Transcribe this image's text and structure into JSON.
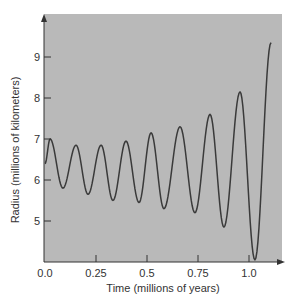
{
  "chart_data": {
    "type": "line",
    "title": "",
    "xlabel": "Time (millions of years)",
    "ylabel": "Radius (millions of kilometers)",
    "xlim": [
      0.0,
      1.17
    ],
    "ylim": [
      4.0,
      10.0
    ],
    "x_ticks": [
      0.0,
      0.25,
      0.5,
      0.75,
      1.0
    ],
    "x_tick_labels": [
      "0.0",
      "0.25",
      "0.5",
      "0.75",
      "1.0"
    ],
    "y_ticks": [
      5,
      6,
      7,
      8,
      9
    ],
    "y_tick_labels": [
      "5",
      "6",
      "7",
      "8",
      "9"
    ],
    "grid": false,
    "legend": null,
    "background": "#b9b9b9",
    "line_color": "#3a3a3a",
    "series": [
      {
        "name": "Radius",
        "points": [
          [
            0.0,
            6.4
          ],
          [
            0.025,
            7.0
          ],
          [
            0.088,
            5.8
          ],
          [
            0.152,
            6.85
          ],
          [
            0.211,
            5.65
          ],
          [
            0.275,
            6.85
          ],
          [
            0.333,
            5.5
          ],
          [
            0.397,
            6.95
          ],
          [
            0.461,
            5.45
          ],
          [
            0.52,
            7.15
          ],
          [
            0.583,
            5.3
          ],
          [
            0.662,
            7.3
          ],
          [
            0.735,
            5.2
          ],
          [
            0.809,
            7.6
          ],
          [
            0.877,
            4.85
          ],
          [
            0.956,
            8.15
          ],
          [
            1.029,
            4.05
          ],
          [
            1.108,
            9.35
          ]
        ]
      }
    ]
  }
}
